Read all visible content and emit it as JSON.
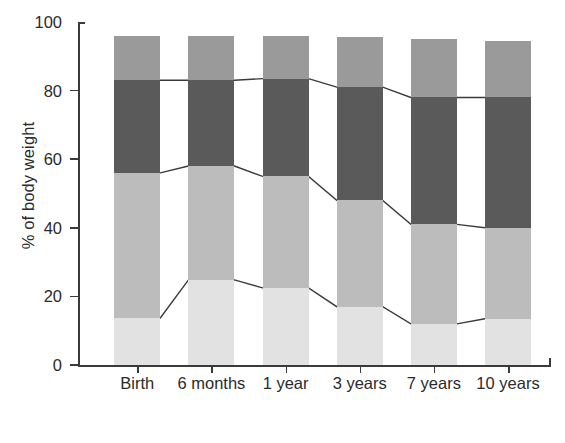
{
  "chart_data": {
    "type": "bar",
    "stacked": true,
    "title": "",
    "xlabel": "",
    "ylabel": "% of body weight",
    "ylim": [
      0,
      100
    ],
    "yticks": [
      0,
      20,
      40,
      60,
      80,
      100
    ],
    "grid": false,
    "legend": "none",
    "categories": [
      "Birth",
      "6 months",
      "1 year",
      "3 years",
      "7 years",
      "10 years"
    ],
    "series": [
      {
        "name": "segment-1-bottom",
        "color": "#e2e2e2",
        "values": [
          13.7,
          24.8,
          22.5,
          17.0,
          12.0,
          13.5
        ]
      },
      {
        "name": "segment-2",
        "color": "#bcbcbc",
        "values": [
          42.3,
          33.2,
          32.5,
          31.0,
          29.0,
          26.5
        ]
      },
      {
        "name": "segment-3",
        "color": "#5a5a5a",
        "values": [
          27.0,
          25.0,
          28.5,
          33.0,
          37.0,
          38.0
        ]
      },
      {
        "name": "segment-4-top",
        "color": "#9a9a9a",
        "values": [
          13.0,
          13.0,
          12.5,
          14.5,
          17.0,
          16.5
        ]
      }
    ],
    "cumulative_tops": [
      [
        13.7,
        56.0,
        83.0,
        96.0
      ],
      [
        24.8,
        58.0,
        83.0,
        96.0
      ],
      [
        22.5,
        55.0,
        83.5,
        96.0
      ],
      [
        17.0,
        48.0,
        81.0,
        95.5
      ],
      [
        12.0,
        41.0,
        78.0,
        95.0
      ],
      [
        13.5,
        40.0,
        78.0,
        94.5
      ]
    ],
    "connector_lines": [
      {
        "name": "boundary-1",
        "level_index": 0,
        "values": [
          13.7,
          24.8,
          22.5,
          17.0,
          12.0,
          13.5
        ]
      },
      {
        "name": "boundary-2",
        "level_index": 1,
        "values": [
          56.0,
          58.0,
          55.0,
          48.0,
          41.0,
          40.0
        ]
      },
      {
        "name": "boundary-3",
        "level_index": 2,
        "values": [
          83.0,
          83.0,
          83.5,
          81.0,
          78.0,
          78.0
        ]
      }
    ]
  },
  "axis": {
    "y_label": "% of body weight",
    "y_ticks": [
      "0",
      "20",
      "40",
      "60",
      "80",
      "100"
    ],
    "x_ticks": [
      "Birth",
      "6 months",
      "1 year",
      "3 years",
      "7 years",
      "10 years"
    ]
  },
  "colors": {
    "segment_1": "#e2e2e2",
    "segment_2": "#bcbcbc",
    "segment_3": "#5a5a5a",
    "segment_4": "#9a9a9a",
    "axis": "#3a3a3a",
    "text": "#2b2b2b",
    "background": "#ffffff"
  }
}
